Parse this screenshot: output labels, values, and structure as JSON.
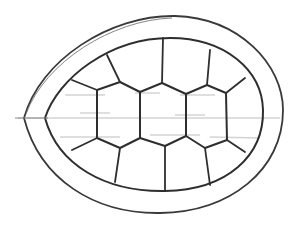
{
  "image": {
    "subject": "pencil sketch of a turtle shell (carapace) viewed from above",
    "style": "graphite line drawing on white",
    "colors": {
      "background": "#ffffff",
      "stroke_dark": "#2e2e2e",
      "stroke_mid": "#555555",
      "stroke_light": "#9a9a9a",
      "shading": "#c8c8c8"
    },
    "parts": {
      "outer_rim": "egg-shaped outer shell edge, pointed on the left",
      "inner_rim": "inner border of the marginal band",
      "center_scutes": "three central hexagonal vertebral scutes",
      "side_scutes": "surrounding costal scutes radiating to the rim"
    }
  }
}
